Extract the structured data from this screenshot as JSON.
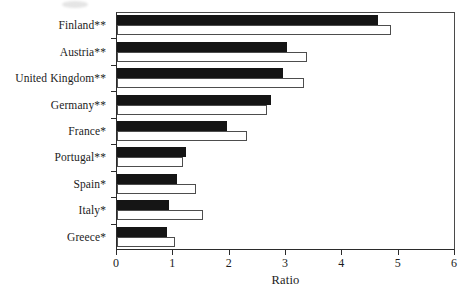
{
  "chart_data": {
    "type": "bar",
    "orientation": "horizontal",
    "title": "",
    "xlabel": "Ratio",
    "ylabel": "",
    "xlim": [
      0,
      6
    ],
    "xticks": [
      0,
      1,
      2,
      3,
      4,
      5,
      6
    ],
    "xtick_labels": [
      "0",
      "1",
      "2",
      "3",
      "4",
      "5",
      "6"
    ],
    "grid": false,
    "legend": "none",
    "categories": [
      "Finland**",
      "Austria**",
      "United Kingdom**",
      "Germany**",
      "France*",
      "Portugal**",
      "Spain*",
      "Italy*",
      "Greece*"
    ],
    "series": [
      {
        "name": "series-1-filled",
        "style": "filled-black",
        "color": "#151515",
        "values": [
          4.64,
          3.01,
          2.95,
          2.74,
          1.96,
          1.22,
          1.06,
          0.92,
          0.89
        ]
      },
      {
        "name": "series-2-open",
        "style": "open-white",
        "color": "#ffffff",
        "values": [
          4.87,
          3.38,
          3.32,
          2.67,
          2.3,
          1.17,
          1.41,
          1.52,
          1.02
        ]
      }
    ]
  },
  "axis": {
    "x_title": "Ratio"
  }
}
